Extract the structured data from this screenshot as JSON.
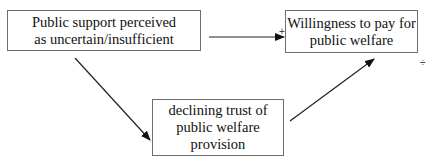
{
  "diagram": {
    "nodes": {
      "left": {
        "line1": "Public support perceived",
        "line2": "as uncertain/insufficient"
      },
      "right": {
        "line1": "Willingness to pay for",
        "line2": "public welfare"
      },
      "bottom": {
        "line1": "declining trust of",
        "line2": "public welfare",
        "line3": "provision"
      }
    },
    "edges": [
      {
        "from": "left",
        "to": "right",
        "sign": "+"
      },
      {
        "from": "left",
        "to": "bottom",
        "sign": ""
      },
      {
        "from": "bottom",
        "to": "right",
        "sign": "÷"
      }
    ],
    "signs": {
      "plus": "+",
      "divide": "÷"
    },
    "colors": {
      "line": "#222222",
      "border": "#6e6e6e"
    }
  }
}
